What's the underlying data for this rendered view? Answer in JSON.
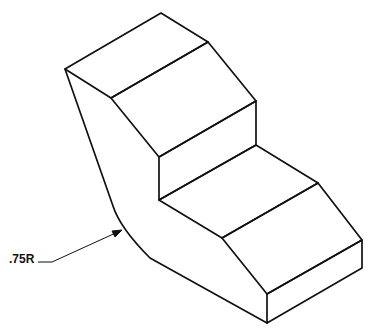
{
  "drawing": {
    "type": "isometric technical drawing",
    "subject": "stepped block with rounded corner",
    "annotation": {
      "label": ".75R",
      "meaning": "radius 0.75"
    },
    "line_color": "#111111",
    "background": "#ffffff"
  }
}
